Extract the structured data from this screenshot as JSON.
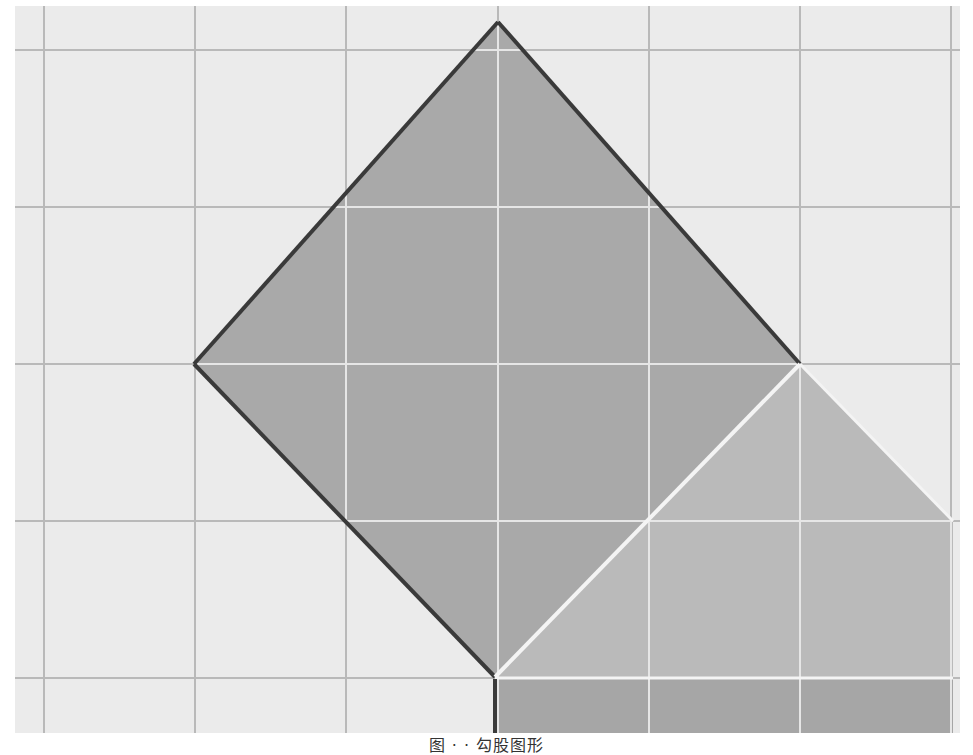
{
  "figure": {
    "background_color": "#ebebeb",
    "grid_line_color": "#b9b9b9",
    "grid_line_inner_color": "#e6e6e6",
    "grid_area": {
      "x": 15,
      "y": 6,
      "width": 945,
      "height": 727
    },
    "grid_vertical_lines": [
      44,
      195,
      346,
      498,
      649,
      800,
      951
    ],
    "grid_horizontal_lines": [
      50,
      207,
      364,
      521,
      678
    ],
    "shapes": {
      "large_square": {
        "description": "square rotated 45 degrees, dark outline",
        "points": [
          [
            498,
            22
          ],
          [
            800,
            364
          ],
          [
            495,
            677
          ],
          [
            194,
            364
          ]
        ],
        "fill": "#a9a9a9",
        "stroke": "#3a3a3a"
      },
      "medium_square": {
        "description": "square rotated 45 degrees, white outline, partially clipped at right",
        "points": [
          [
            800,
            364
          ],
          [
            953,
            521
          ],
          [
            953,
            677
          ],
          [
            495,
            677
          ]
        ],
        "fill": "#bababa",
        "stroke": "#f4f4f4"
      },
      "bottom_square": {
        "description": "axis-aligned square below, clipped at bottom",
        "points": [
          [
            495,
            679
          ],
          [
            953,
            679
          ],
          [
            953,
            733
          ],
          [
            495,
            733
          ]
        ],
        "fill": "#a6a6a6",
        "stroke": "#3a3a3a"
      }
    }
  },
  "caption": {
    "text": "图 ·  ·  勾股图形"
  }
}
